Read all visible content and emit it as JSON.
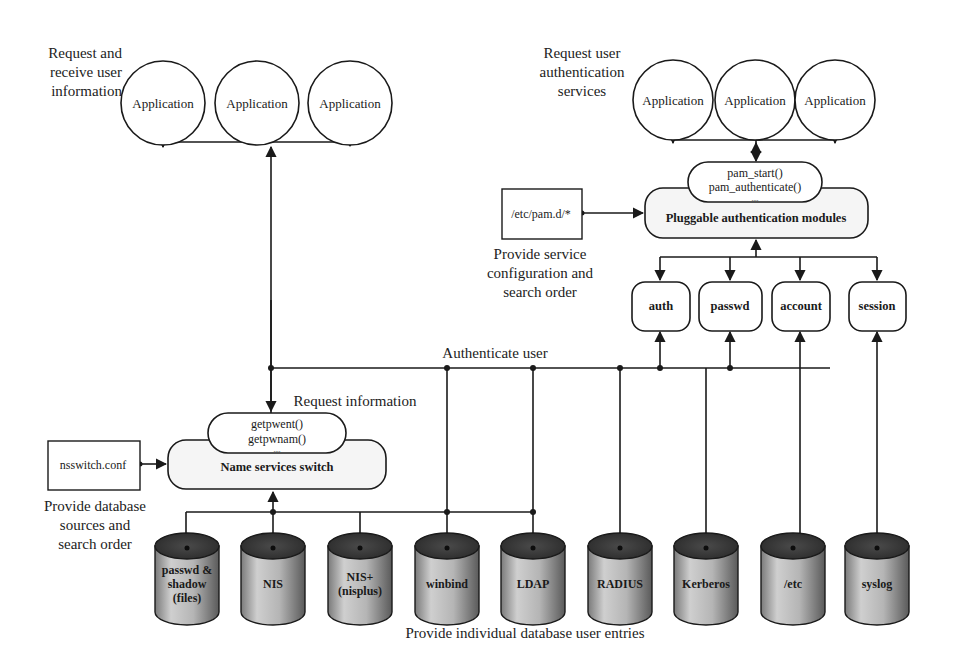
{
  "nss_side": {
    "caption_lines": [
      "Request and",
      "receive user",
      "information"
    ],
    "applications": [
      {
        "label": "Application"
      },
      {
        "label": "Application"
      },
      {
        "label": "Application"
      }
    ],
    "request_label": "Request information",
    "api_calls": [
      "getpwent()",
      "getpwnam()",
      "...."
    ],
    "switch_label": "Name services switch",
    "config_file": "nsswitch.conf",
    "config_caption_lines": [
      "Provide database",
      "sources and",
      "search order"
    ]
  },
  "pam_side": {
    "caption_lines": [
      "Request user",
      "authentication",
      "services"
    ],
    "applications": [
      {
        "label": "Application"
      },
      {
        "label": "Application"
      },
      {
        "label": "Application"
      }
    ],
    "api_calls": [
      "pam_start()",
      "pam_authenticate()",
      "...."
    ],
    "pam_label": "Pluggable authentication modules",
    "config_file": "/etc/pam.d/*",
    "config_caption_lines": [
      "Provide service",
      "configuration and",
      "search order"
    ],
    "modules": [
      {
        "label": "auth"
      },
      {
        "label": "passwd"
      },
      {
        "label": "account"
      },
      {
        "label": "session"
      }
    ]
  },
  "authenticate_label": "Authenticate user",
  "databases": [
    {
      "lines": [
        "passwd &",
        "shadow",
        "(files)"
      ]
    },
    {
      "lines": [
        "NIS"
      ]
    },
    {
      "lines": [
        "NIS+",
        "(nisplus)"
      ]
    },
    {
      "lines": [
        "winbind"
      ]
    },
    {
      "lines": [
        "LDAP"
      ]
    },
    {
      "lines": [
        "RADIUS"
      ]
    },
    {
      "lines": [
        "Kerberos"
      ]
    },
    {
      "lines": [
        "/etc"
      ]
    },
    {
      "lines": [
        "syslog"
      ]
    }
  ],
  "bottom_caption": "Provide individual database user entries",
  "colors": {
    "line": "#1a1a1a",
    "box_fill": "#ffffff",
    "box_fill_grey": "#f2f2f2",
    "cylinder_top": "#3a3a3a",
    "cylinder_body_light": "#c9c9c9",
    "cylinder_body_dark": "#6a6a6a"
  }
}
